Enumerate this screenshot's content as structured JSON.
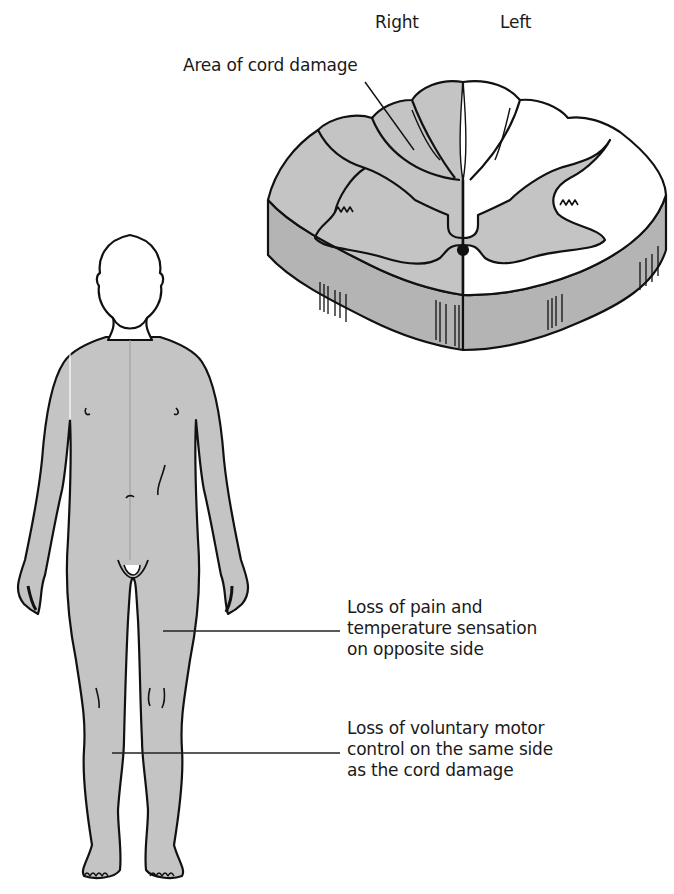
{
  "diagram": {
    "colors": {
      "affected_fill": "#c4c4c4",
      "cord_side_fill": "#b4b4b4",
      "unaffected_fill": "#ffffff",
      "outline": "#111111"
    },
    "cord_section": {
      "side_labels": {
        "right": "Right",
        "left": "Left"
      },
      "damage_label": "Area of cord damage"
    },
    "body_annotations": [
      {
        "id": "pain",
        "text": "Loss of pain and\ntemperature sensation\non opposite side"
      },
      {
        "id": "motor",
        "text": "Loss of voluntary motor\ncontrol on the same side\nas the cord damage"
      }
    ]
  }
}
